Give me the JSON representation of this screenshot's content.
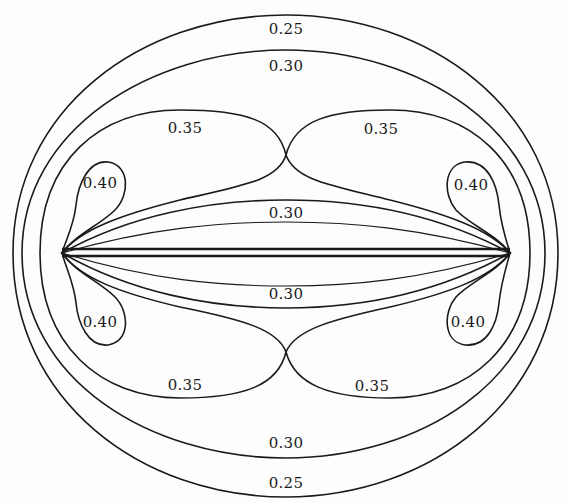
{
  "diagram": {
    "labels": {
      "outer_top": "0.25",
      "second_top": "0.30",
      "lobe_top_left": "0.35",
      "lobe_top_right": "0.35",
      "tip_top_left": "0.40",
      "tip_top_right": "0.40",
      "inner_top": "0.30",
      "inner_bottom": "0.30",
      "tip_bottom_left": "0.40",
      "tip_bottom_right": "0.40",
      "lobe_bottom_left": "0.35",
      "lobe_bottom_right": "0.35",
      "second_bottom": "0.30",
      "outer_bottom": "0.25"
    },
    "contour_levels": [
      "0.25",
      "0.30",
      "0.35",
      "0.40"
    ],
    "colors": {
      "ink": "#1a1a1a",
      "paper": "#fdfdfd"
    }
  }
}
